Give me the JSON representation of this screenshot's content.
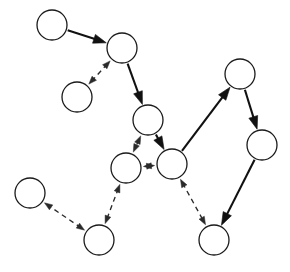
{
  "diagram": {
    "type": "node-link-diagram",
    "canvas": {
      "width": 290,
      "height": 272,
      "background": "#ffffff"
    },
    "node_radius": 15,
    "colors": {
      "node_fill": "#ffffff",
      "node_stroke": "#1a1a1a",
      "solid_edge": "#111111",
      "dashed_edge": "#2a2a2a"
    },
    "nodes": [
      {
        "id": "A",
        "label": "",
        "cx": 52,
        "cy": 25,
        "r": 15
      },
      {
        "id": "B",
        "label": "",
        "cx": 122,
        "cy": 48,
        "r": 15
      },
      {
        "id": "C",
        "label": "",
        "cx": 77,
        "cy": 97,
        "r": 15
      },
      {
        "id": "D",
        "label": "",
        "cx": 148,
        "cy": 120,
        "r": 15
      },
      {
        "id": "E",
        "label": "",
        "cx": 126,
        "cy": 168,
        "r": 15
      },
      {
        "id": "F",
        "label": "",
        "cx": 172,
        "cy": 164,
        "r": 15
      },
      {
        "id": "G",
        "label": "",
        "cx": 240,
        "cy": 74,
        "r": 15
      },
      {
        "id": "H",
        "label": "",
        "cx": 262,
        "cy": 145,
        "r": 15
      },
      {
        "id": "I",
        "label": "",
        "cx": 30,
        "cy": 193,
        "r": 15
      },
      {
        "id": "J",
        "label": "",
        "cx": 99,
        "cy": 240,
        "r": 15
      },
      {
        "id": "K",
        "label": "",
        "cx": 214,
        "cy": 240,
        "r": 15
      }
    ],
    "edges": [
      {
        "from": "A",
        "to": "B",
        "style": "solid",
        "direction": "forward"
      },
      {
        "from": "B",
        "to": "D",
        "style": "solid",
        "direction": "forward"
      },
      {
        "from": "D",
        "to": "F",
        "style": "solid",
        "direction": "forward"
      },
      {
        "from": "F",
        "to": "G",
        "style": "solid",
        "direction": "forward"
      },
      {
        "from": "G",
        "to": "H",
        "style": "solid",
        "direction": "forward"
      },
      {
        "from": "H",
        "to": "K",
        "style": "solid",
        "direction": "forward"
      },
      {
        "from": "B",
        "to": "C",
        "style": "dashed",
        "direction": "both"
      },
      {
        "from": "D",
        "to": "E",
        "style": "dashed",
        "direction": "both"
      },
      {
        "from": "E",
        "to": "F",
        "style": "dashed",
        "direction": "both"
      },
      {
        "from": "E",
        "to": "J",
        "style": "dashed",
        "direction": "both"
      },
      {
        "from": "J",
        "to": "I",
        "style": "dashed",
        "direction": "both"
      },
      {
        "from": "F",
        "to": "K",
        "style": "dashed",
        "direction": "both"
      }
    ]
  }
}
